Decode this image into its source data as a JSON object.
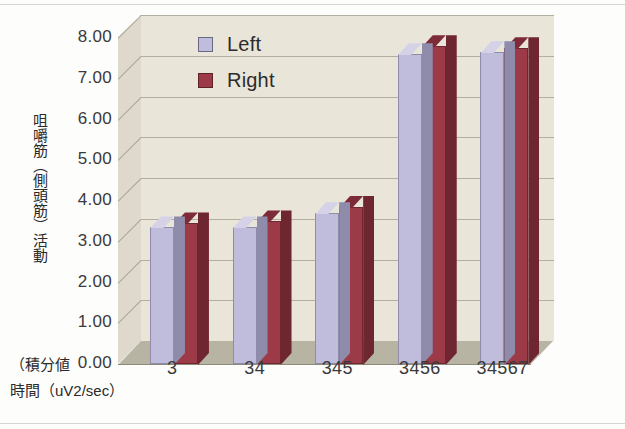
{
  "chart_data": {
    "type": "bar",
    "title": "",
    "subtitle": "",
    "xlabel": "（積分値\n時間（uV2/sec）",
    "ylabel": "咀嚼筋（側頭筋）活動",
    "categories": [
      "3",
      "34",
      "345",
      "3456",
      "34567"
    ],
    "series": [
      {
        "name": "Left",
        "color": "#bfbcdc",
        "values": [
          3.35,
          3.35,
          3.7,
          7.6,
          7.65
        ]
      },
      {
        "name": "Right",
        "color": "#9c3a48",
        "values": [
          3.45,
          3.5,
          3.85,
          7.8,
          7.75
        ]
      }
    ],
    "ylim": [
      0.0,
      8.0
    ],
    "ytick_step": 1.0,
    "ytick_labels": [
      "8.00",
      "7.00",
      "6.00",
      "5.00",
      "4.00",
      "3.00",
      "2.00",
      "1.00",
      "0.00"
    ],
    "ytick_values": [
      8.0,
      7.0,
      6.0,
      5.0,
      4.0,
      3.0,
      2.0,
      1.0,
      0.0
    ],
    "grid": true,
    "grid_axis": "y",
    "legend_position": "top-left",
    "three_d": true,
    "annotations": []
  },
  "axes": {
    "y_title": "咀嚼筋（側頭筋）活動",
    "x_caption_line1": "（積分値",
    "x_caption_line2": "時間（uV2/sec）"
  },
  "legend": {
    "items": [
      {
        "label": "Left",
        "color": "#bfbcdc"
      },
      {
        "label": "Right",
        "color": "#9c3a48"
      }
    ]
  },
  "colors": {
    "plot_background": "#e9e5d8",
    "side_wall": "#ded9cc",
    "floor": "#b8b4a4",
    "gridline": "#b3afa0",
    "page_background": "#fdfdfc",
    "left_series": "#bfbcdc",
    "left_series_top": "#d5d2e8",
    "left_series_side": "#8f8cab",
    "right_series": "#9c3a48",
    "right_series_top": "#7d2b37",
    "right_series_side": "#6e2630",
    "text": "#2a2a2a"
  }
}
